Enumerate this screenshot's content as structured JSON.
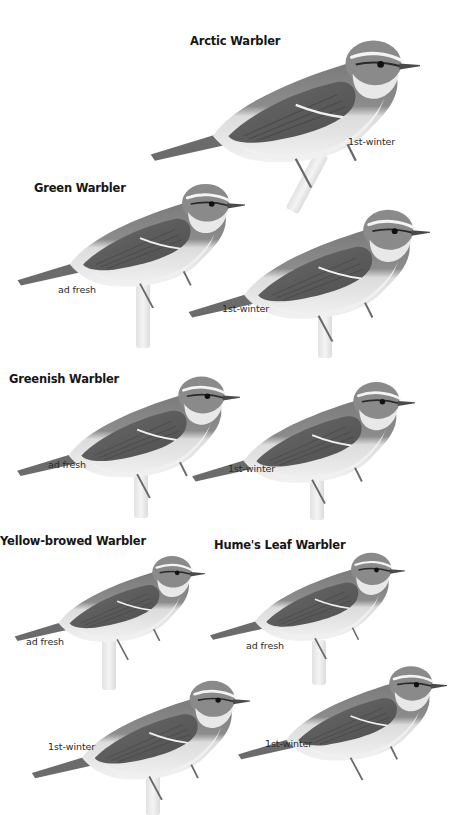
{
  "plate": {
    "background": "#ffffff",
    "palette": {
      "upperparts": "#6e6e6e",
      "wing_dark": "#555555",
      "crown": "#7a7a7a",
      "underparts": "#ececec",
      "supercilium": "#f4f4f4",
      "eye_stripe": "#222222",
      "bill": "#4a4a4a",
      "legs": "#6a6a6a",
      "perch": "#e6e6e6"
    },
    "species": [
      {
        "name": "Arctic Warbler",
        "figures": [
          {
            "age": "1st-winter"
          }
        ]
      },
      {
        "name": "Green Warbler",
        "figures": [
          {
            "age": "ad fresh"
          },
          {
            "age": "1st-winter"
          }
        ]
      },
      {
        "name": "Greenish Warbler",
        "figures": [
          {
            "age": "ad fresh"
          },
          {
            "age": "1st-winter"
          }
        ]
      },
      {
        "name": "Yellow-browed Warbler",
        "figures": [
          {
            "age": "ad fresh"
          },
          {
            "age": "1st-winter"
          }
        ]
      },
      {
        "name": "Hume's Leaf Warbler",
        "figures": [
          {
            "age": "ad fresh"
          },
          {
            "age": "1st-winter"
          }
        ]
      }
    ]
  }
}
